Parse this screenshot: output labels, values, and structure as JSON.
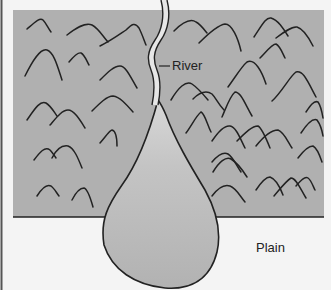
{
  "diagram": {
    "labels": {
      "river": "River",
      "plain": "Plain"
    },
    "regions": [
      {
        "name": "mountains",
        "fill": "#b0b0b0"
      },
      {
        "name": "alluvial-fan",
        "fill": "#bdbdbd"
      },
      {
        "name": "plain",
        "fill": "#f4f4f4"
      }
    ]
  }
}
